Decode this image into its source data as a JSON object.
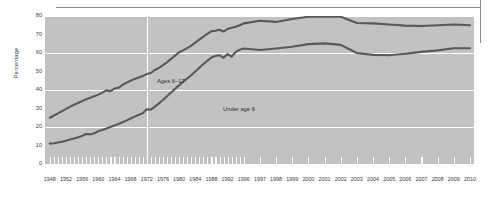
{
  "chart_data": {
    "type": "line",
    "title": "",
    "subtitle": "",
    "xlabel": "",
    "ylabel": "Percentage",
    "ylim": [
      0,
      80
    ],
    "yticks": [
      0,
      10,
      20,
      30,
      40,
      50,
      60,
      70,
      80
    ],
    "gridlines_y": [
      20,
      40,
      60,
      80
    ],
    "grid": true,
    "legend_position": "inline-annotations",
    "annotations": [
      {
        "text": "Ages 6–17",
        "series": "Ages 6–17"
      },
      {
        "text": "Under age 6",
        "series": "Under age 6"
      }
    ],
    "x_tick_labels": [
      "1948",
      "1952",
      "1956",
      "1960",
      "1964",
      "1968",
      "1972",
      "1976",
      "1980",
      "1984",
      "1988",
      "1992",
      "1996",
      "1997",
      "1998",
      "1999",
      "2000",
      "2001",
      "2002",
      "2003",
      "2004",
      "2005",
      "2006",
      "2007",
      "2008",
      "2009",
      "2010"
    ],
    "x": [
      1948,
      1949,
      1950,
      1951,
      1952,
      1953,
      1954,
      1955,
      1956,
      1957,
      1958,
      1959,
      1960,
      1961,
      1962,
      1963,
      1964,
      1965,
      1966,
      1967,
      1968,
      1969,
      1970,
      1971,
      1972,
      1973,
      1974,
      1975,
      1976,
      1977,
      1978,
      1979,
      1980,
      1981,
      1982,
      1983,
      1984,
      1985,
      1986,
      1987,
      1988,
      1989,
      1990,
      1991,
      1992,
      1993,
      1994,
      1995,
      1996,
      1997,
      1998,
      1999,
      2000,
      2001,
      2002,
      2003,
      2004,
      2005,
      2006,
      2007,
      2008,
      2009,
      2010
    ],
    "series": [
      {
        "name": "Ages 6–17",
        "color": "#595959",
        "values": [
          25.0,
          26.2,
          27.4,
          28.6,
          29.8,
          31.0,
          32.0,
          33.0,
          34.0,
          35.0,
          35.8,
          36.6,
          37.5,
          38.6,
          39.8,
          39.4,
          40.8,
          41.2,
          42.8,
          44.0,
          45.0,
          46.0,
          46.8,
          47.6,
          48.6,
          49.2,
          50.8,
          52.0,
          53.4,
          55.0,
          56.8,
          58.6,
          60.4,
          61.4,
          62.6,
          64.0,
          65.6,
          67.2,
          68.8,
          70.4,
          71.8,
          72.0,
          72.6,
          71.6,
          73.0,
          73.6,
          74.2,
          75.0,
          76.0,
          77.4,
          76.8,
          78.4,
          79.6,
          79.8,
          79.6,
          76.2,
          76.0,
          75.4,
          74.8,
          74.6,
          75.0,
          75.4,
          75.0
        ],
        "marker_label_value": "Ages 6–17"
      },
      {
        "name": "Under age 6",
        "color": "#595959",
        "values": [
          11.0,
          11.2,
          11.6,
          12.0,
          12.6,
          13.2,
          13.8,
          14.4,
          15.2,
          16.2,
          16.0,
          16.6,
          17.8,
          18.4,
          19.2,
          20.0,
          20.8,
          21.6,
          22.6,
          23.6,
          24.6,
          25.6,
          26.6,
          27.4,
          29.6,
          29.4,
          31.0,
          32.8,
          34.6,
          36.6,
          38.6,
          40.6,
          42.6,
          44.4,
          46.2,
          48.0,
          50.0,
          52.0,
          54.0,
          55.8,
          57.6,
          58.4,
          58.8,
          57.4,
          59.4,
          58.0,
          60.6,
          61.8,
          62.4,
          61.6,
          62.4,
          63.4,
          64.8,
          65.2,
          64.4,
          60.0,
          59.0,
          58.8,
          59.6,
          60.6,
          61.4,
          62.6,
          62.6
        ],
        "marker_label_value": "Under age 6"
      }
    ],
    "colors": {
      "plot_background": "#c2c2c2",
      "gridline": "#ffffff",
      "line": "#595959",
      "text": "#3a3a3a",
      "rule": "#8a8a8a"
    }
  }
}
